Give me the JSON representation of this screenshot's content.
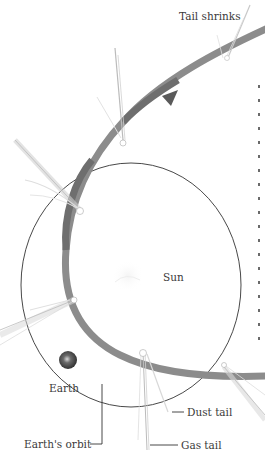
{
  "diagram": {
    "labels": {
      "tail_shrinks": "Tail shrinks",
      "sun": "Sun",
      "earth": "Earth",
      "dust_tail": "Dust tail",
      "gas_tail": "Gas tail",
      "earths_orbit": "Earth's orbit"
    },
    "colors": {
      "comet_orbit": "#8c8c8c",
      "comet_orbit_dark": "#6e6e6e",
      "earth_orbit": "#333333",
      "tail": "#d9d9d9",
      "text": "#3a3a3a",
      "earth": "#4a4a4a"
    },
    "elements": {
      "comet_orbit": "Comet orbit (thick gray elliptical band, arrow indicating direction of travel)",
      "earth_orbit": "Earth orbit (thin dark circle around the Sun)",
      "sun": "Sun (faint center)",
      "earth": "Earth (small dark sphere on its orbit)",
      "comets": 6
    }
  }
}
